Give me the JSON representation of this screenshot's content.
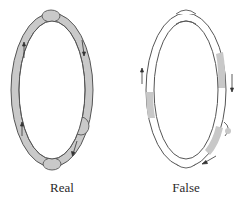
{
  "figure": {
    "panels": [
      {
        "id": "real",
        "label": "Real",
        "ring_fill": "#c9c9c9",
        "outline": "#555555",
        "bulges": [
          "top",
          "right-lower",
          "bottom"
        ],
        "arrows": [
          "left-upper-up",
          "right-upper-down",
          "left-lower-up",
          "right-lower-down"
        ]
      },
      {
        "id": "false",
        "label": "False",
        "ring_fill": "#ffffff",
        "shade": "#c8c8c8",
        "outline": "#555555",
        "bulges": [
          "top",
          "right-lower",
          "bottom"
        ],
        "arrows": [
          "left-up",
          "right-down",
          "bottom-left"
        ]
      }
    ]
  }
}
